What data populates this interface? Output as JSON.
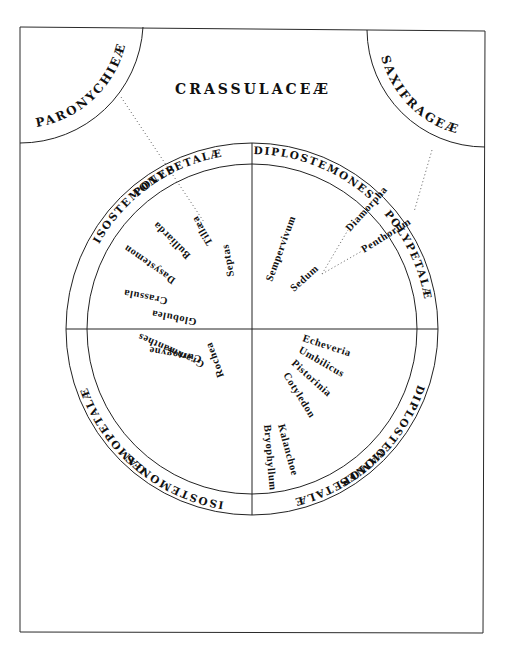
{
  "diagram": {
    "title": "CRASSULACEÆ",
    "corners": {
      "left": "PARONYCHIEÆ",
      "right": "SAXIFRAGEÆ"
    },
    "ring": {
      "top_left": "POLYPETALÆ",
      "left_upper": "ISOSTEMONES",
      "top_right": "DIPLOSTEMONES",
      "right_upper": "POLYPETALÆ",
      "right_lower": "DIPLOSTEMONES",
      "bottom_right": "GAMOPETALÆ",
      "left_lower": "GAMOPETALÆ",
      "bottom_left": "ISOSTEMONES"
    },
    "quadrants": {
      "isostemones_polypetalae": [
        "Tillæa",
        "Bulliarda",
        "Dasystemon",
        "Septas",
        "Crassula",
        "Globulea"
      ],
      "diplostemones_polypetalae": [
        "Sempervivum",
        "Sedum",
        "Diamorpha",
        "Penthorum"
      ],
      "isostemones_gamopetalae": [
        "Curtogyne",
        "Grammanthes",
        "Rochea"
      ],
      "diplostemones_gamopetalae": [
        "Echeveria",
        "Umbilicus",
        "Pistorinia",
        "Cotyledon",
        "Kalanchoe",
        "Bryophyllum"
      ]
    },
    "colors": {
      "ink": "#111111",
      "paper": "#ffffff",
      "dotted": "#777777"
    }
  }
}
